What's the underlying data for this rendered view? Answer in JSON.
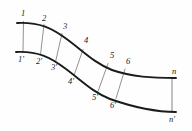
{
  "figure": {
    "background_color": "#fefefe",
    "rail_color": "#1b1b1b",
    "rung_color": "#6d6d6d",
    "label_color": "#1d1d1d"
  },
  "upper_rail": {
    "name": "upper-rail",
    "path": "M 17 23 C 40 22 52 28 68 40 C 84 52 96 64 112 70 C 132 77 152 78 176 78"
  },
  "lower_rail": {
    "name": "lower-rail",
    "path": "M 16 52 C 38 51 50 57 66 69 C 82 81 94 93 110 99 C 130 106 152 112 176 112"
  },
  "rungs": [
    {
      "name": "rung-1",
      "x1": 23.5,
      "y1": 21.5,
      "x2": 23.0,
      "y2": 52.0
    },
    {
      "name": "rung-2",
      "x1": 44.0,
      "y1": 24.5,
      "x2": 40.5,
      "y2": 54.5
    },
    {
      "name": "rung-3",
      "x1": 62.0,
      "y1": 33.5,
      "x2": 55.5,
      "y2": 62.0
    },
    {
      "name": "rung-4",
      "x1": 83.0,
      "y1": 49.5,
      "x2": 74.0,
      "y2": 75.5
    },
    {
      "name": "rung-5",
      "x1": 108.0,
      "y1": 63.5,
      "x2": 98.0,
      "y2": 91.5
    },
    {
      "name": "rung-6",
      "x1": 125.0,
      "y1": 69.0,
      "x2": 116.0,
      "y2": 98.5
    },
    {
      "name": "rung-n",
      "x1": 172.0,
      "y1": 78.0,
      "x2": 172.0,
      "y2": 112.5
    }
  ],
  "upper_labels": [
    {
      "name": "node-label-1",
      "text": "1",
      "x": 21,
      "y": 9
    },
    {
      "name": "node-label-2",
      "text": "2",
      "x": 42,
      "y": 14
    },
    {
      "name": "node-label-3",
      "text": "3",
      "x": 63,
      "y": 22
    },
    {
      "name": "node-label-4",
      "text": "4",
      "x": 84,
      "y": 36
    },
    {
      "name": "node-label-5",
      "text": "5",
      "x": 110,
      "y": 51
    },
    {
      "name": "node-label-6",
      "text": "6",
      "x": 126,
      "y": 57
    },
    {
      "name": "node-label-n",
      "text": "n",
      "x": 172,
      "y": 67
    }
  ],
  "lower_labels": [
    {
      "name": "node-label-1-prime",
      "text": "1'",
      "x": 18,
      "y": 55
    },
    {
      "name": "node-label-2-prime",
      "text": "2'",
      "x": 36,
      "y": 57
    },
    {
      "name": "node-label-3-prime",
      "text": "3'",
      "x": 51,
      "y": 63
    },
    {
      "name": "node-label-4-prime",
      "text": "4'",
      "x": 68,
      "y": 77
    },
    {
      "name": "node-label-5-prime",
      "text": "5'",
      "x": 92,
      "y": 93
    },
    {
      "name": "node-label-6-prime",
      "text": "6'",
      "x": 110,
      "y": 101
    },
    {
      "name": "node-label-n-prime",
      "text": "n'",
      "x": 169,
      "y": 115
    }
  ]
}
